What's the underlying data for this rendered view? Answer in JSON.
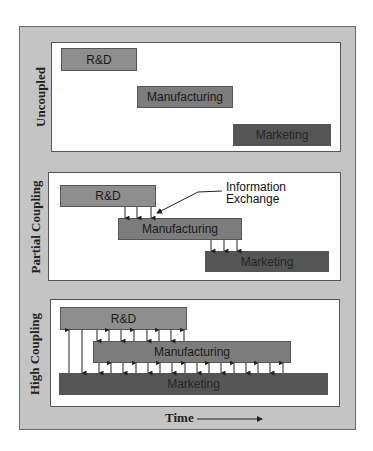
{
  "diagram": {
    "panels": [
      {
        "label": "Uncoupled",
        "bars": {
          "rd": "R&D",
          "manufacturing": "Manufacturing",
          "marketing": "Marketing"
        }
      },
      {
        "label": "Partial Coupling",
        "bars": {
          "rd": "R&D",
          "manufacturing": "Manufacturing",
          "marketing": "Marketing"
        },
        "annotation": [
          "Information",
          "Exchange"
        ]
      },
      {
        "label": "High Coupling",
        "bars": {
          "rd": "R&D",
          "manufacturing": "Manufacturing",
          "marketing": "Marketing"
        }
      }
    ],
    "time_axis_label": "Time",
    "colors": {
      "frame": "#c4c4c4",
      "panel": "#ffffff",
      "rd": "#8e8e8e",
      "manufacturing": "#7c7c7c",
      "marketing": "#555555"
    }
  }
}
